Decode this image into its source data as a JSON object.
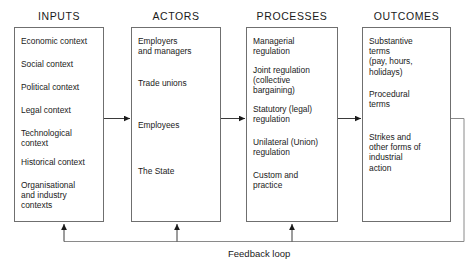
{
  "diagram": {
    "title_label": "Feedback loop",
    "columns": [
      {
        "header": "INPUTS",
        "items": [
          "Economic context",
          "Social context",
          "Political context",
          "Legal context",
          "Technological\ncontext",
          "Historical context",
          "Organisational\nand industry\ncontexts"
        ]
      },
      {
        "header": "ACTORS",
        "items": [
          "Employers\nand managers",
          "Trade unions",
          "Employees",
          "The State"
        ]
      },
      {
        "header": "PROCESSES",
        "items": [
          "Managerial\nregulation",
          "Joint regulation\n(collective\nbargaining)",
          "Statutory (legal)\nregulation",
          "Unilateral (Union)\nregulation",
          "Custom and\npractice"
        ]
      },
      {
        "header": "OUTCOMES",
        "items": [
          "Substantive\nterms\n(pay, hours,\nholidays)",
          "Procedural\nterms",
          "Strikes and\nother forms of\nindustrial\naction"
        ]
      }
    ],
    "colors": {
      "line": "#6f6f6f",
      "arrow": "#1a1a1a",
      "text": "#1a1a1a",
      "background": "#ffffff"
    }
  }
}
